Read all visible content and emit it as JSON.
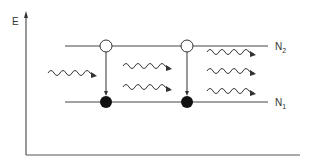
{
  "diagram": {
    "type": "energy-level-diagram",
    "axis": {
      "label": "E"
    },
    "levels": [
      {
        "name": "N",
        "subscript": "2",
        "y": 46
      },
      {
        "name": "N",
        "subscript": "1",
        "y": 102
      }
    ],
    "transitions": [
      {
        "x": 106,
        "from": "N2",
        "to": "N1"
      },
      {
        "x": 187,
        "from": "N2",
        "to": "N1"
      }
    ],
    "photons": {
      "incoming": 1,
      "middle": 2,
      "outgoing": 3
    },
    "colors": {
      "stroke": "#333333",
      "background": "#ffffff"
    }
  }
}
